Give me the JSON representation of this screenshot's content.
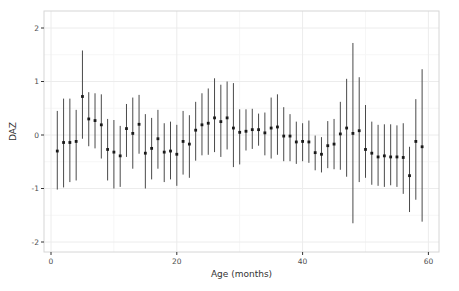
{
  "figure": {
    "background": "#ffffff",
    "panel_border_color": "#d6d6d6",
    "grid_major_color": "#ececec",
    "grid_minor_color": "#f6f6f6",
    "point_color": "#1a1a1a",
    "errorbar_color": "#4a4a4a",
    "tick_color": "#333333"
  },
  "chart_data": {
    "type": "scatter",
    "title": "",
    "xlabel": "Age (months)",
    "ylabel": "DAZ",
    "xlim": [
      -1,
      61
    ],
    "ylim": [
      -2.2,
      2.1
    ],
    "x_ticks": [
      0,
      20,
      40,
      60
    ],
    "y_ticks": [
      2,
      1,
      0,
      -1,
      -2
    ],
    "x_minor_ticks": [
      10,
      30,
      50
    ],
    "y_minor_ticks": [
      1.5,
      0.5,
      -0.5,
      -1.5
    ],
    "grid": "on",
    "legend_position": "none",
    "series_name": "DAZ mean with error bars by age in months",
    "x": [
      1,
      2,
      3,
      4,
      5,
      6,
      7,
      8,
      9,
      10,
      11,
      12,
      13,
      14,
      15,
      16,
      17,
      18,
      19,
      20,
      21,
      22,
      23,
      24,
      25,
      26,
      27,
      28,
      29,
      30,
      31,
      32,
      33,
      34,
      35,
      36,
      37,
      38,
      39,
      40,
      41,
      42,
      43,
      44,
      45,
      46,
      47,
      48,
      49,
      50,
      51,
      52,
      53,
      54,
      55,
      56,
      57,
      58,
      59
    ],
    "y": [
      -0.3,
      -0.14,
      -0.14,
      -0.12,
      0.72,
      0.3,
      0.27,
      0.19,
      -0.27,
      -0.32,
      -0.39,
      0.12,
      0.03,
      0.2,
      -0.34,
      -0.25,
      -0.07,
      -0.32,
      -0.3,
      -0.36,
      -0.12,
      -0.17,
      0.09,
      0.19,
      0.22,
      0.32,
      0.25,
      0.32,
      0.13,
      0.05,
      0.07,
      0.1,
      0.1,
      0.04,
      0.13,
      0.15,
      -0.02,
      -0.02,
      -0.13,
      -0.12,
      -0.13,
      -0.33,
      -0.36,
      -0.2,
      -0.17,
      0.02,
      0.13,
      0.03,
      0.08,
      -0.27,
      -0.34,
      -0.41,
      -0.39,
      -0.41,
      -0.41,
      -0.42,
      -0.76,
      -0.12,
      -0.22
    ],
    "ci_low": [
      -1.02,
      -0.98,
      -0.88,
      -0.85,
      -0.07,
      -0.21,
      -0.25,
      -0.44,
      -0.85,
      -1.0,
      -0.97,
      -0.41,
      -0.63,
      -0.35,
      -1.0,
      -0.83,
      -0.63,
      -0.88,
      -0.83,
      -0.95,
      -0.74,
      -0.8,
      -0.48,
      -0.38,
      -0.37,
      -0.32,
      -0.41,
      -0.27,
      -0.6,
      -0.55,
      -0.29,
      -0.26,
      -0.2,
      -0.38,
      -0.44,
      -0.37,
      -0.49,
      -0.49,
      -0.54,
      -0.49,
      -0.52,
      -0.66,
      -0.7,
      -0.62,
      -0.64,
      -0.65,
      -0.78,
      -1.65,
      -0.88,
      -0.8,
      -0.93,
      -0.95,
      -0.97,
      -0.94,
      -0.97,
      -1.1,
      -1.44,
      -1.21,
      -1.62
    ],
    "ci_high": [
      0.45,
      0.68,
      0.68,
      0.47,
      1.58,
      0.8,
      0.78,
      0.76,
      0.3,
      0.28,
      0.17,
      0.58,
      0.7,
      0.75,
      0.39,
      0.32,
      0.47,
      0.22,
      0.25,
      0.19,
      0.45,
      0.37,
      0.62,
      0.78,
      0.87,
      1.06,
      0.94,
      1.0,
      0.97,
      0.48,
      0.48,
      0.49,
      0.4,
      0.42,
      0.7,
      0.76,
      0.52,
      0.39,
      0.25,
      0.22,
      0.27,
      -0.01,
      -0.04,
      0.26,
      0.3,
      0.62,
      1.05,
      1.72,
      1.08,
      0.56,
      0.25,
      0.19,
      0.2,
      0.2,
      0.18,
      0.22,
      -0.22,
      0.67,
      1.23
    ]
  }
}
